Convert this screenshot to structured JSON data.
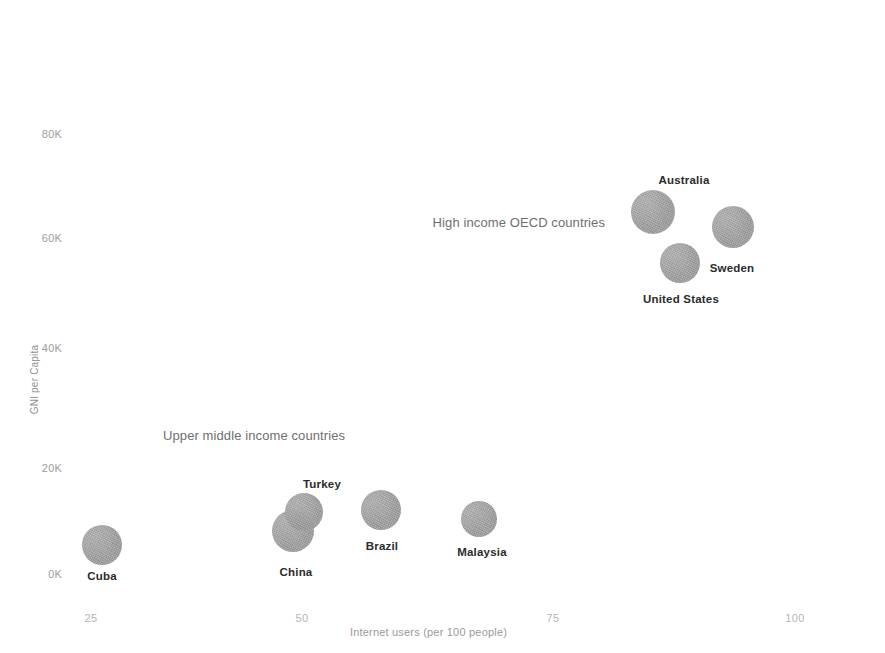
{
  "chart_data": {
    "type": "scatter",
    "title": "",
    "xlabel": "Internet users (per 100 people)",
    "ylabel": "GNI per Capita",
    "xlim": [
      20,
      102
    ],
    "ylim": [
      0,
      86000
    ],
    "grid": false,
    "legend": "none",
    "x_ticks": [
      {
        "label": "25",
        "value": 25
      },
      {
        "label": "50",
        "value": 50
      },
      {
        "label": "75",
        "value": 75
      },
      {
        "label": "100",
        "value": 100
      }
    ],
    "y_ticks": [
      {
        "label": "0K",
        "value": 0
      },
      {
        "label": "20K",
        "value": 20000
      },
      {
        "label": "40K",
        "value": 40000
      },
      {
        "label": "60K",
        "value": 60000
      },
      {
        "label": "80K",
        "value": 80000
      }
    ],
    "groups": [
      {
        "name": "High income OECD countries",
        "label": "High income OECD countries"
      },
      {
        "name": "Upper middle income countries",
        "label": "Upper middle income countries"
      }
    ],
    "points": [
      {
        "label": "Cuba",
        "group": "Upper middle income countries",
        "x": 26,
        "y": 5500,
        "px": 102,
        "py": 545,
        "r": 20,
        "label_px": 102,
        "label_py": 570
      },
      {
        "label": "China",
        "group": "Upper middle income countries",
        "x": 46,
        "y": 8000,
        "px": 293,
        "py": 531,
        "r": 21,
        "label_px": 296,
        "label_py": 566
      },
      {
        "label": "Turkey",
        "group": "Upper middle income countries",
        "x": 48,
        "y": 11700,
        "px": 304,
        "py": 512,
        "r": 19,
        "label_px": 322,
        "label_py": 478
      },
      {
        "label": "Brazil",
        "group": "Upper middle income countries",
        "x": 56,
        "y": 12000,
        "px": 381,
        "py": 510,
        "r": 20,
        "label_px": 382,
        "label_py": 540
      },
      {
        "label": "Malaysia",
        "group": "Upper middle income countries",
        "x": 66,
        "y": 10400,
        "px": 479,
        "py": 519,
        "r": 18,
        "label_px": 482,
        "label_py": 546
      },
      {
        "label": "Australia",
        "group": "High income OECD countries",
        "x": 85,
        "y": 68000,
        "px": 653,
        "py": 212,
        "r": 22,
        "label_px": 684,
        "label_py": 174
      },
      {
        "label": "Sweden",
        "group": "High income OECD countries",
        "x": 93,
        "y": 65000,
        "px": 733,
        "py": 227,
        "r": 21,
        "label_px": 732,
        "label_py": 262
      },
      {
        "label": "United States",
        "group": "High income OECD countries",
        "x": 88,
        "y": 58000,
        "px": 680,
        "py": 263,
        "r": 20,
        "label_px": 681,
        "label_py": 293
      }
    ],
    "group_annotations": [
      {
        "label": "High income OECD countries",
        "px": 605,
        "py": 215,
        "align": "right"
      },
      {
        "label": "Upper middle income countries",
        "px": 163,
        "py": 428,
        "align": "left"
      }
    ],
    "colors": {
      "bubble": "#9b9b9b",
      "point_label": "#2b2b2b",
      "group_label": "#6f6f6f",
      "axis_label": "#9d9d9d",
      "background": "#ffffff"
    }
  },
  "axis": {
    "y_title": "GNI per Capita",
    "x_title": "Internet users (per 100 people)",
    "y_tick_labels": [
      "80K",
      "60K",
      "40K",
      "20K",
      "0K"
    ],
    "x_tick_labels": [
      "25",
      "50",
      "75",
      "100"
    ],
    "y_tick_py": [
      134,
      238,
      348,
      468,
      574
    ],
    "x_tick_px": [
      91,
      302,
      553,
      795
    ],
    "y_label_right_px": 62,
    "x_label_py": 612
  }
}
